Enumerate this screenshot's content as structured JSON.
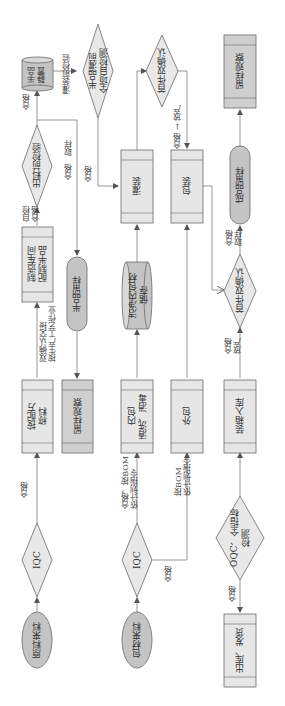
{
  "diagram": {
    "orientation": "rotated-90-cw",
    "colors": {
      "process_fill": "#e6e6e6",
      "process_band": "#d6d6d6",
      "observe_fill": "#cfcfcf",
      "terminal_fill": "#c4c4c4",
      "decision_fill": "#e8e8e8",
      "stroke": "#6a6a6a",
      "line": "#8a8a8a"
    },
    "nodes": {
      "raw_material_in": "原料来料",
      "iqc_raw": "IQC",
      "weigh_by_formula": "按配方\n称料",
      "workshop_prep": "制造车间\n配制半品",
      "pre_discharge_inspect": "出料前检验",
      "semi_rest": "半品\n静置",
      "semi_full_test": "半品灌前\n全项目检测",
      "sample_observe_1": "留样观察",
      "semi_sample": "半品留样",
      "pack_material_in": "包材来料",
      "iqc_pack": "IQC",
      "inner_pack_clean": "内包\n清洗、消毒",
      "clean_inner_storage": "洁净内包材\n储存",
      "filling": "灌装",
      "outer_pack": "外包",
      "packaging": "包装",
      "first_piece_confirm_1": "首件双确认",
      "oqc": "OQC、全指标\n检测",
      "ship_out": "出库、发货",
      "box_warehouse": "装箱入库",
      "first_piece_confirm_2": "首件双确认",
      "finished_sample": "成品留样",
      "sample_observe_2": "留样观察"
    },
    "edge_labels": {
      "raw_iqc_pass": "合格",
      "weigh_to_prep": "双确认交接\n按生产工艺作业",
      "prep_self_check": "自检\n合格",
      "discharge_pass_sample": "合格　取样",
      "discharge_to_rest": "合格",
      "rest_to_test": "灌装前检验",
      "test_to_filling": "合格",
      "pack_iqc_pass_inner": "合格，按BOM\n依计划指令",
      "pack_iqc_pass": "合格",
      "outer_bom": "按BOM\n依计划指令",
      "first1_pass_release": "合格 → 放产",
      "oqc_pass": "合格",
      "first2_pass_release": "合格\n放产",
      "first2_pass_sample": "合格\n取样"
    }
  }
}
